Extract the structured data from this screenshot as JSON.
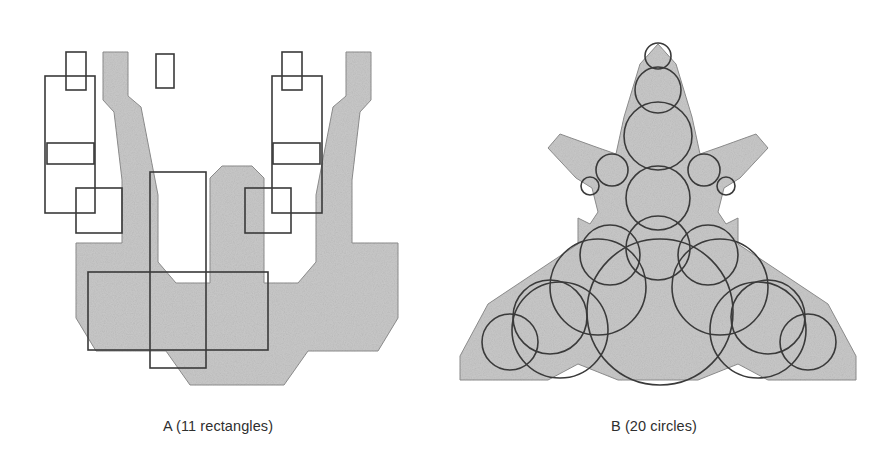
{
  "page": {
    "background_color": "#ffffff",
    "width": 873,
    "height": 472
  },
  "style": {
    "silhouette_fill": "#c9c9c9",
    "silhouette_stroke": "#8f8f8f",
    "primitive_stroke": "#3a3a3a",
    "primitive_stroke_width": 1.6,
    "caption_color": "#2f2f2f"
  },
  "panels": [
    {
      "id": "panel-a",
      "caption": "A (11 rectangles)",
      "label": "A",
      "primitive_type": "rectangle",
      "primitive_count": 11,
      "silhouette_name": "robot-figure-silhouette",
      "silhouette_path": "M 103 52 L 128 52 L 128 96 L 141 107 L 158 195 L 158 262 L 176 283 L 210 283 L 210 178 L 222 166 L 252 166 L 264 178 L 264 283 L 298 283 L 316 262 L 316 195 L 333 107 L 346 96 L 346 52 L 371 52 L 371 100 L 360 112 L 352 180 L 352 243 L 398 243 L 398 318 L 378 351 L 308 351 L 284 385 L 190 385 L 166 351 L 96 351 L 76 318 L 76 243 L 122 243 L 122 180 L 114 112 L 103 100 Z",
      "primitives": [
        {
          "name": "rect-left-antenna",
          "x": 66,
          "y": 52,
          "w": 20,
          "h": 38
        },
        {
          "name": "rect-left-shoulder-bar",
          "x": 47,
          "y": 143,
          "w": 47,
          "h": 21
        },
        {
          "name": "rect-left-upper-arm",
          "x": 45,
          "y": 76,
          "w": 50,
          "h": 137
        },
        {
          "name": "rect-left-elbow-block",
          "x": 76,
          "y": 188,
          "w": 46,
          "h": 45
        },
        {
          "name": "rect-right-antenna",
          "x": 282,
          "y": 52,
          "w": 20,
          "h": 38
        },
        {
          "name": "rect-right-shoulder-bar",
          "x": 273,
          "y": 143,
          "w": 47,
          "h": 21
        },
        {
          "name": "rect-right-upper-arm",
          "x": 272,
          "y": 76,
          "w": 50,
          "h": 137
        },
        {
          "name": "rect-right-elbow-block",
          "x": 245,
          "y": 188,
          "w": 46,
          "h": 45
        },
        {
          "name": "rect-center-torso",
          "x": 150,
          "y": 172,
          "w": 56,
          "h": 196
        },
        {
          "name": "rect-hip-bar",
          "x": 88,
          "y": 272,
          "w": 180,
          "h": 78
        },
        {
          "name": "rect-head-cap",
          "x": 156,
          "y": 54,
          "w": 18,
          "h": 34
        }
      ]
    },
    {
      "id": "panel-b",
      "caption": "B (20 circles)",
      "label": "B",
      "primitive_type": "circle",
      "primitive_count": 20,
      "silhouette_name": "insect-figure-silhouette",
      "silhouette_path": "M 220 32 L 238 52 L 254 105 L 262 142 L 282 135 L 318 122 L 330 136 L 302 166 L 286 176 L 280 200 L 288 212 L 300 206 L 300 232 L 390 292 L 418 344 L 418 368 L 330 368 L 300 352 L 260 368 L 180 368 L 140 352 L 110 368 L 22 368 L 22 344 L 50 292 L 140 232 L 140 206 L 152 212 L 160 200 L 154 176 L 138 166 L 110 136 L 122 122 L 158 135 L 178 142 L 186 105 L 202 52 Z",
      "primitives": [
        {
          "name": "circle-head-top",
          "cx": 220,
          "cy": 44,
          "r": 13
        },
        {
          "name": "circle-head-upper",
          "cx": 220,
          "cy": 78,
          "r": 23
        },
        {
          "name": "circle-head-main",
          "cx": 220,
          "cy": 124,
          "r": 34
        },
        {
          "name": "circle-left-ear",
          "cx": 174,
          "cy": 158,
          "r": 16
        },
        {
          "name": "circle-left-ear-tip",
          "cx": 152,
          "cy": 174,
          "r": 9
        },
        {
          "name": "circle-right-ear",
          "cx": 266,
          "cy": 158,
          "r": 16
        },
        {
          "name": "circle-right-ear-tip",
          "cx": 288,
          "cy": 174,
          "r": 9
        },
        {
          "name": "circle-neck",
          "cx": 220,
          "cy": 186,
          "r": 32
        },
        {
          "name": "circle-thorax",
          "cx": 220,
          "cy": 236,
          "r": 32
        },
        {
          "name": "circle-abdomen",
          "cx": 222,
          "cy": 300,
          "r": 73
        },
        {
          "name": "circle-left-wing-inner",
          "cx": 172,
          "cy": 243,
          "r": 30
        },
        {
          "name": "circle-left-wing-mid",
          "cx": 160,
          "cy": 275,
          "r": 48
        },
        {
          "name": "circle-left-wing-outer",
          "cx": 112,
          "cy": 305,
          "r": 37
        },
        {
          "name": "circle-left-wing-tip",
          "cx": 72,
          "cy": 330,
          "r": 28
        },
        {
          "name": "circle-left-wing-lower",
          "cx": 122,
          "cy": 318,
          "r": 48
        },
        {
          "name": "circle-right-wing-inner",
          "cx": 270,
          "cy": 243,
          "r": 30
        },
        {
          "name": "circle-right-wing-mid",
          "cx": 282,
          "cy": 275,
          "r": 48
        },
        {
          "name": "circle-right-wing-outer",
          "cx": 330,
          "cy": 305,
          "r": 37
        },
        {
          "name": "circle-right-wing-tip",
          "cx": 370,
          "cy": 330,
          "r": 28
        },
        {
          "name": "circle-right-wing-lower",
          "cx": 320,
          "cy": 318,
          "r": 48
        }
      ]
    }
  ]
}
